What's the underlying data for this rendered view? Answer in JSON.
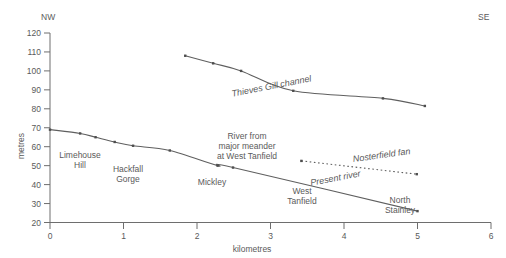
{
  "chart_data": {
    "type": "line",
    "title": "",
    "xlabel": "kilometres",
    "ylabel": "metres",
    "xlim": [
      0,
      6
    ],
    "ylim": [
      20,
      120
    ],
    "xticks": [
      "0",
      "1",
      "2",
      "3",
      "4",
      "5",
      "6"
    ],
    "yticks": [
      "20",
      "30",
      "40",
      "50",
      "60",
      "70",
      "80",
      "90",
      "100",
      "110",
      "120"
    ],
    "grid": false,
    "legend_position": "inline-annotations",
    "orientation_labels": {
      "left": "NW",
      "right": "SE"
    },
    "series": [
      {
        "name": "Thieves Gill channel",
        "style": "solid",
        "label_x": 3.18,
        "label_y": 96.5,
        "label_rotation": -11,
        "x": [
          1.84,
          2.22,
          2.6,
          3.31,
          4.53,
          5.1
        ],
        "y": [
          108.0,
          104.0,
          100.0,
          89.5,
          85.5,
          81.5
        ]
      },
      {
        "name": "Present river",
        "style": "solid",
        "label_x": 3.78,
        "label_y": 44.5,
        "label_rotation": -11,
        "x": [
          0.0,
          0.41,
          0.62,
          0.88,
          1.13,
          1.63,
          2.28,
          2.49,
          5.0
        ],
        "y": [
          69.0,
          67.0,
          65.0,
          62.5,
          60.5,
          58.0,
          50.0,
          49.0,
          26.0
        ]
      },
      {
        "name": "Nosterfield fan",
        "style": "dotted",
        "label_x": 4.4,
        "label_y": 51.0,
        "label_rotation": -8,
        "x": [
          3.42,
          4.99
        ],
        "y": [
          52.5,
          45.5
        ]
      }
    ],
    "annotations": [
      {
        "text": "Limehouse\nHill",
        "x": 0.41,
        "y": 58.0,
        "align": "middle"
      },
      {
        "text": "Hackfall\nGorge",
        "x": 1.06,
        "y": 49.5,
        "align": "middle"
      },
      {
        "text": "Mickley",
        "x": 2.2,
        "y": 43.0,
        "align": "middle"
      },
      {
        "text": "River from\nmajor meander\nat West Tanfield",
        "x": 2.95,
        "y": 61.5,
        "align": "middle"
      },
      {
        "text": "West\nTanfield",
        "x": 3.73,
        "y": 36.5,
        "align": "middle"
      },
      {
        "text": "North\nStainley",
        "x": 5.06,
        "y": 30.0,
        "align": "middle"
      }
    ]
  },
  "labels": {
    "nw": "NW",
    "se": "SE",
    "y_axis_title": "metres",
    "x_axis_title": "kilometres",
    "y_120": "120",
    "y_110": "110",
    "y_100": "100",
    "y_90": "90",
    "y_80": "80",
    "y_70": "70",
    "y_60": "60",
    "y_50": "50",
    "y_40": "40",
    "y_30": "30",
    "y_20": "20",
    "x_0": "0",
    "x_1": "1",
    "x_2": "2",
    "x_3": "3",
    "x_4": "4",
    "x_5": "5",
    "x_6": "6",
    "series_thieves": "Thieves Gill channel",
    "series_present": "Present river",
    "series_nosterfield": "Nosterfield fan",
    "place_limehouse_1": "Limehouse",
    "place_limehouse_2": "Hill",
    "place_hackfall_1": "Hackfall",
    "place_hackfall_2": "Gorge",
    "place_mickley": "Mickley",
    "place_meander_1": "River from",
    "place_meander_2": "major meander",
    "place_meander_3": "at West Tanfield",
    "place_westtanfield_1": "West",
    "place_westtanfield_2": "Tanfield",
    "place_northstainley_1": "North",
    "place_northstainley_2": "Stainley"
  }
}
